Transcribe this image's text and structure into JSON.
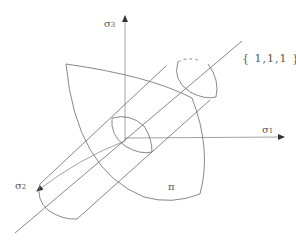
{
  "diagram": {
    "type": "haigh-westergaard-stress-space",
    "axes": {
      "sigma1": {
        "symbol": "σ",
        "subscript": "1"
      },
      "sigma2": {
        "symbol": "σ",
        "subscript": "2"
      },
      "sigma3": {
        "symbol": "σ",
        "subscript": "3"
      }
    },
    "hydrostatic_axis_label": "{ 1,1,1 }",
    "plane_label": "π",
    "colors": {
      "line": "#6a6a6a",
      "arrow": "#333333",
      "text": "#555555",
      "background": "#ffffff"
    }
  }
}
